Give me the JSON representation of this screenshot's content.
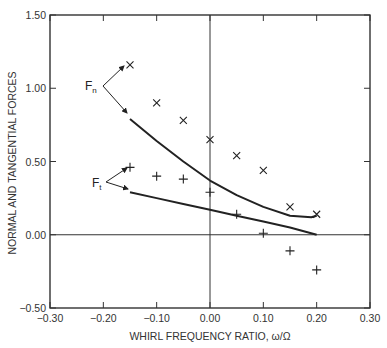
{
  "chart_data": {
    "type": "scatter",
    "title": "",
    "xlabel": "WHIRL FREQUENCY RATIO, ω/Ω",
    "ylabel": "NORMAL AND TANGENTIAL FORCES",
    "xlim": [
      -0.3,
      0.3
    ],
    "ylim": [
      -0.5,
      1.5
    ],
    "xticks": [
      -0.3,
      -0.2,
      -0.1,
      0.0,
      0.1,
      0.2,
      0.3
    ],
    "xtick_labels": [
      "−0.30",
      "−0.20",
      "−0.10",
      "0.00",
      "0.10",
      "0.20",
      "0.30"
    ],
    "yticks": [
      -0.5,
      0.0,
      0.5,
      1.0,
      1.5
    ],
    "ytick_labels": [
      "−0.50",
      "0.00",
      "0.50",
      "1.00",
      "1.50"
    ],
    "grid": false,
    "reference_lines": {
      "x": 0.0,
      "y": 0.0
    },
    "series": [
      {
        "name": "Fn measured",
        "marker": "x",
        "x": [
          -0.15,
          -0.1,
          -0.05,
          0.0,
          0.05,
          0.1,
          0.15,
          0.2
        ],
        "y": [
          1.16,
          0.9,
          0.78,
          0.65,
          0.54,
          0.44,
          0.19,
          0.14
        ]
      },
      {
        "name": "Ft measured",
        "marker": "+",
        "x": [
          -0.15,
          -0.1,
          -0.05,
          0.0,
          0.05,
          0.1,
          0.15,
          0.2
        ],
        "y": [
          0.46,
          0.4,
          0.38,
          0.29,
          0.14,
          0.01,
          -0.11,
          -0.24
        ]
      },
      {
        "name": "Fn theory",
        "marker": "line",
        "x": [
          -0.15,
          -0.1,
          -0.05,
          0.0,
          0.05,
          0.1,
          0.15,
          0.19,
          0.2
        ],
        "y": [
          0.79,
          0.64,
          0.5,
          0.37,
          0.27,
          0.19,
          0.13,
          0.12,
          0.13
        ]
      },
      {
        "name": "Ft theory",
        "marker": "line",
        "x": [
          -0.15,
          -0.1,
          -0.05,
          0.0,
          0.05,
          0.1,
          0.15,
          0.2
        ],
        "y": [
          0.29,
          0.25,
          0.21,
          0.17,
          0.13,
          0.09,
          0.05,
          0.0
        ]
      }
    ],
    "annotations": [
      {
        "text": "Fn",
        "sub": "n",
        "main": "F"
      },
      {
        "text": "Ft",
        "sub": "t",
        "main": "F"
      }
    ]
  }
}
